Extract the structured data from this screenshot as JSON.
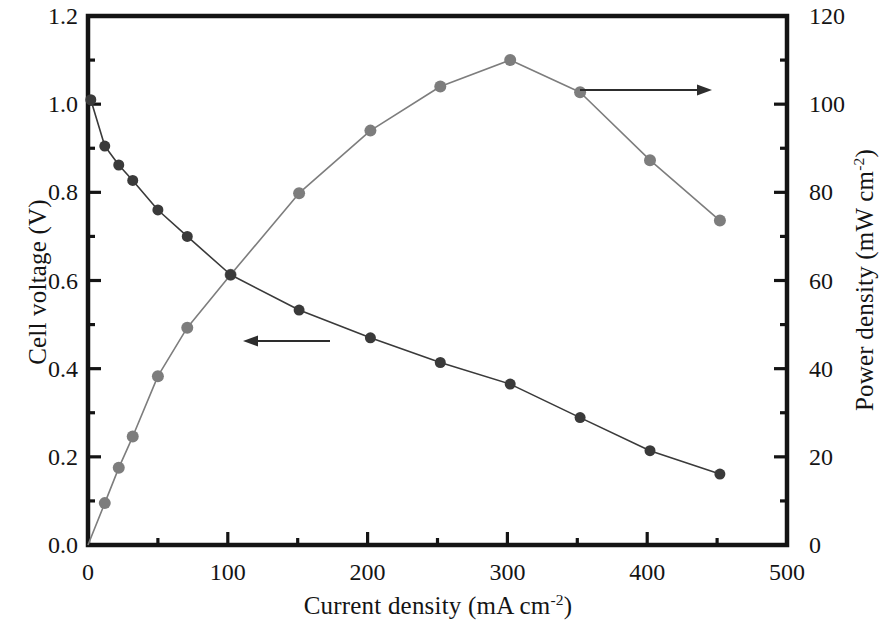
{
  "figure": {
    "background_color": "#ffffff",
    "frame_color": "#141414"
  },
  "axes": {
    "left": {
      "title_main": "Cell voltage (V)",
      "ticks": [
        "0.0",
        "0.2",
        "0.4",
        "0.6",
        "0.8",
        "1.0",
        "1.2"
      ],
      "min": 0.0,
      "max": 1.2,
      "minor_step": 0.1
    },
    "right": {
      "title_main": "Power density (mW cm",
      "title_sup": "-2",
      "title_tail": ")",
      "ticks": [
        "0",
        "20",
        "40",
        "60",
        "80",
        "100",
        "120"
      ],
      "min": 0,
      "max": 120,
      "minor_step": 10
    },
    "bottom": {
      "title_main": "Current density (mA cm",
      "title_sup": "-2",
      "title_tail": ")",
      "ticks": [
        "0",
        "100",
        "200",
        "300",
        "400",
        "500"
      ],
      "min": 0,
      "max": 500,
      "minor_step": 50
    }
  },
  "annotations": {
    "left_arrow": {
      "label": "arrow pointing to left cell voltage axis",
      "x_start": 330,
      "x_end": 243,
      "y": 341
    },
    "right_arrow": {
      "label": "arrow pointing to right power density axis",
      "x_start": 580,
      "x_end": 712,
      "y": 90
    }
  },
  "chart_data": {
    "type": "line",
    "title": "",
    "xlabel": "Current density (mA cm-2)",
    "ylabel": "Cell voltage (V)",
    "y2label": "Power density (mW cm-2)",
    "xlim": [
      0,
      500
    ],
    "ylim": [
      0.0,
      1.2
    ],
    "y2lim": [
      0,
      120
    ],
    "grid": false,
    "legend": "none (arrows indicate axis association)",
    "series": [
      {
        "name": "Cell voltage (V)",
        "axis": "left",
        "marker": "filled-circle",
        "color": "#3a3a3a",
        "marker_size": 11,
        "line_style": "solid-thin",
        "x": [
          2,
          12,
          22,
          32,
          50,
          71,
          102,
          151,
          202,
          252,
          302,
          352,
          402,
          452
        ],
        "y": [
          1.01,
          0.905,
          0.862,
          0.827,
          0.76,
          0.7,
          0.613,
          0.533,
          0.47,
          0.414,
          0.365,
          0.289,
          0.214,
          0.161
        ]
      },
      {
        "name": "Power density (mW cm-2)",
        "axis": "right",
        "marker": "filled-circle",
        "color": "#7d7d7d",
        "marker_size": 12,
        "line_style": "solid-thin",
        "x": [
          0,
          12,
          22,
          32,
          50,
          71,
          102,
          151,
          202,
          252,
          302,
          352,
          402,
          452
        ],
        "y": [
          0,
          9.5,
          17.5,
          24.6,
          38.3,
          49.3,
          61.3,
          79.8,
          94.0,
          104.0,
          110.0,
          102.7,
          87.3,
          73.6
        ]
      }
    ]
  }
}
